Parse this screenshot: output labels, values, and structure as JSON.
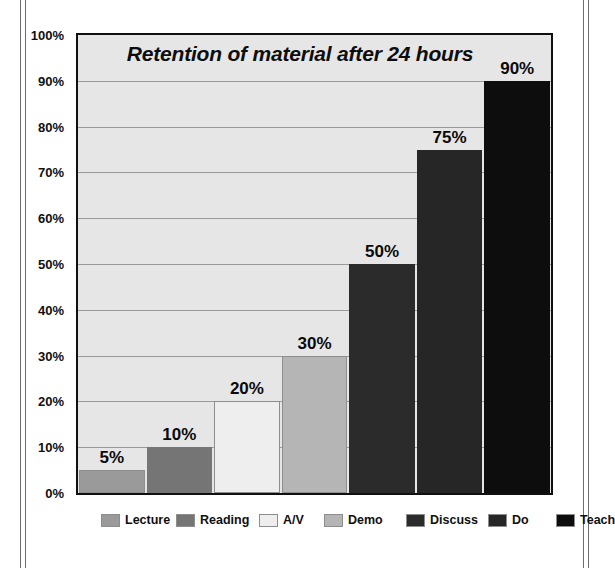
{
  "chart_data": {
    "type": "bar",
    "title": "Retention of material after 24 hours",
    "xlabel": "",
    "ylabel": "",
    "ylim": [
      0,
      100
    ],
    "grid": true,
    "legend_position": "bottom",
    "categories": [
      "Lecture",
      "Reading",
      "A/V",
      "Demo",
      "Discuss",
      "Do",
      "Teach"
    ],
    "values": [
      5,
      10,
      20,
      30,
      50,
      75,
      90
    ],
    "data_labels": [
      "5%",
      "10%",
      "20%",
      "30%",
      "50%",
      "75%",
      "90%"
    ],
    "series": [
      {
        "name": "Retention",
        "values": [
          5,
          10,
          20,
          30,
          50,
          75,
          90
        ]
      }
    ],
    "bar_colors": [
      "#9a9a9a",
      "#757575",
      "#eeeeee",
      "#b5b5b5",
      "#2b2b2b",
      "#262626",
      "#0d0d0d"
    ],
    "yticks": [
      "0%",
      "10%",
      "20%",
      "30%",
      "40%",
      "50%",
      "60%",
      "70%",
      "80%",
      "90%",
      "100%"
    ],
    "ytick_values": [
      0,
      10,
      20,
      30,
      40,
      50,
      60,
      70,
      80,
      90,
      100
    ]
  },
  "legend": {
    "items": [
      {
        "label": "Lecture",
        "color": "#9a9a9a"
      },
      {
        "label": "Reading",
        "color": "#757575"
      },
      {
        "label": "A/V",
        "color": "#eeeeee"
      },
      {
        "label": "Demo",
        "color": "#b5b5b5"
      },
      {
        "label": "Discuss",
        "color": "#2b2b2b"
      },
      {
        "label": "Do",
        "color": "#262626"
      },
      {
        "label": "Teach",
        "color": "#0d0d0d"
      }
    ]
  },
  "plot": {
    "background_color": "#e6e6e6",
    "border_color": "#101010",
    "gridline_color": "#9a9a9a"
  }
}
